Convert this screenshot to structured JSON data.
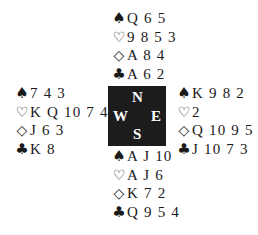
{
  "suits": {
    "spades": "♠",
    "hearts": "♡",
    "diamonds": "◇",
    "clubs": "♣"
  },
  "compass": {
    "north": "N",
    "south": "S",
    "west": "W",
    "east": "E"
  },
  "hands": {
    "north": {
      "spades": "Q 6 5",
      "hearts": "9 8 5 3",
      "diamonds": "A 8 4",
      "clubs": "A 6 2"
    },
    "west": {
      "spades": "7 4 3",
      "hearts": "K Q 10 7 4",
      "diamonds": "J 6 3",
      "clubs": "K 8"
    },
    "east": {
      "spades": "K 9 8 2",
      "hearts": "2",
      "diamonds": "Q 10 9 5",
      "clubs": "J 10 7 3"
    },
    "south": {
      "spades": "A J 10",
      "hearts": "A J 6",
      "diamonds": "K 7 2",
      "clubs": "Q 9 5 4"
    }
  }
}
